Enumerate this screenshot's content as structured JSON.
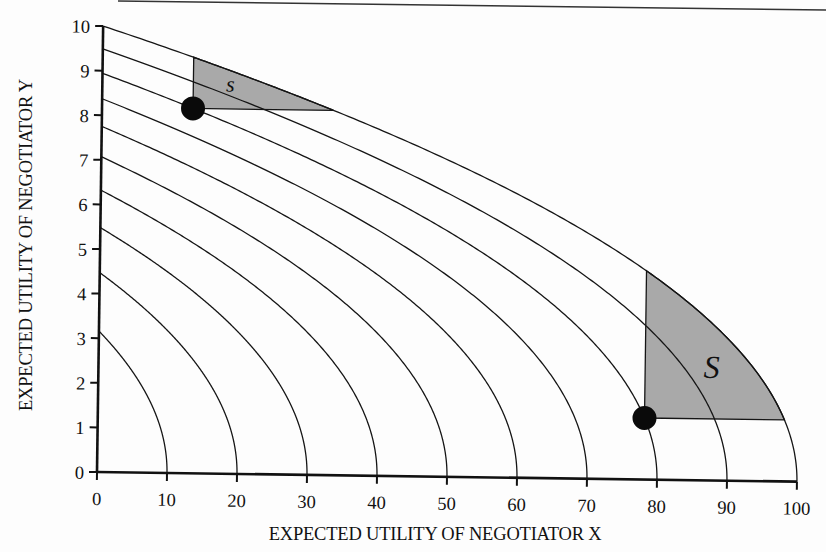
{
  "chart_data": {
    "type": "line",
    "title": "",
    "xlabel": "EXPECTED UTILITY OF NEGOTIATOR X",
    "ylabel": "EXPECTED UTILITY OF NEGOTIATOR Y",
    "xlim": [
      0,
      100
    ],
    "ylim": [
      0,
      10
    ],
    "x_ticks": [
      0,
      10,
      20,
      30,
      40,
      50,
      60,
      70,
      80,
      90,
      100
    ],
    "y_ticks": [
      0,
      1,
      2,
      3,
      4,
      5,
      6,
      7,
      8,
      9,
      10
    ],
    "grid": false,
    "legend": null,
    "curve_model": "y = y_intercept * sqrt(1 - x / x_intercept)",
    "series": [
      {
        "name": "curve-100",
        "x_intercept": 100,
        "y_intercept": 10.0
      },
      {
        "name": "curve-90",
        "x_intercept": 90,
        "y_intercept": 9.49
      },
      {
        "name": "curve-80",
        "x_intercept": 80,
        "y_intercept": 8.94
      },
      {
        "name": "curve-70",
        "x_intercept": 70,
        "y_intercept": 8.37
      },
      {
        "name": "curve-60",
        "x_intercept": 60,
        "y_intercept": 7.75
      },
      {
        "name": "curve-50",
        "x_intercept": 50,
        "y_intercept": 7.07
      },
      {
        "name": "curve-40",
        "x_intercept": 40,
        "y_intercept": 6.32
      },
      {
        "name": "curve-30",
        "x_intercept": 30,
        "y_intercept": 5.48
      },
      {
        "name": "curve-20",
        "x_intercept": 20,
        "y_intercept": 4.47
      },
      {
        "name": "curve-10",
        "x_intercept": 10,
        "y_intercept": 3.16
      }
    ],
    "points": [
      {
        "name": "point-left",
        "x": 13.0,
        "y": 8.18
      },
      {
        "name": "point-right",
        "x": 78.1,
        "y": 1.38
      }
    ],
    "regions": [
      {
        "name": "small-s",
        "label": "s",
        "corner": [
          13.0,
          8.18
        ],
        "bounded_by": "curve-100",
        "fill": "#a9a9a9"
      },
      {
        "name": "big-S",
        "label": "S",
        "corner": [
          78.1,
          1.38
        ],
        "bounded_by": "curve-100",
        "fill": "#a9a9a9"
      }
    ]
  },
  "style": {
    "line_color": "#151515",
    "fill_color": "#a9a9a9",
    "dot_color": "#0a0a0a"
  }
}
